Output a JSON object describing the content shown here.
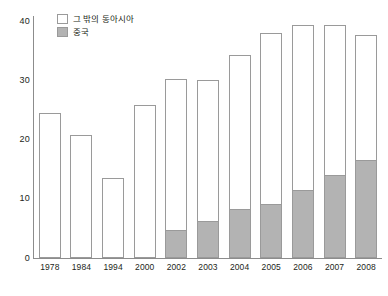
{
  "chart_data": {
    "type": "bar",
    "subtype": "stacked-bar",
    "title": "",
    "xlabel": "",
    "ylabel": "",
    "ylim": [
      0,
      40
    ],
    "yticks": [
      0,
      10,
      20,
      30,
      40
    ],
    "ytick_labels": [
      "0",
      "10",
      "20",
      "30",
      "40"
    ],
    "grid": false,
    "legend_position": "top-left",
    "categories": [
      "1978",
      "1984",
      "1994",
      "2000",
      "2002",
      "2003",
      "2004",
      "2005",
      "2006",
      "2007",
      "2008"
    ],
    "series": [
      {
        "name": "중국",
        "color": "#b3b3b3",
        "values": [
          0,
          0,
          0,
          0,
          4.8,
          6.3,
          8.3,
          9.1,
          11.5,
          14.0,
          16.5
        ]
      },
      {
        "name": "그 밖의 동아시아",
        "color": "#ffffff",
        "values": [
          24.5,
          20.7,
          13.5,
          25.8,
          25.4,
          23.7,
          25.9,
          28.9,
          27.8,
          25.3,
          21.2
        ]
      }
    ],
    "totals": [
      24.5,
      20.7,
      13.5,
      25.8,
      30.2,
      30.0,
      34.2,
      38.0,
      39.3,
      39.3,
      37.7
    ]
  },
  "legend": {
    "items": [
      {
        "label": "그 밖의 동아시아",
        "swatch": "white-square"
      },
      {
        "label": "중국",
        "swatch": "gray-square"
      }
    ]
  },
  "colors": {
    "china_fill": "#b3b3b3",
    "other_fill": "#ffffff",
    "bar_stroke": "#9a9a9a",
    "axis": "#8c8c8c",
    "text": "#231f20"
  }
}
